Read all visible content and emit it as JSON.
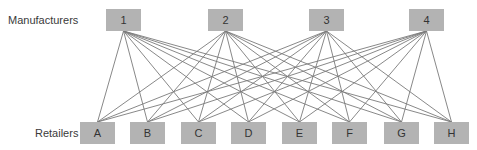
{
  "labels": {
    "manufacturers": "Manufacturers",
    "retailers": "Retailers"
  },
  "manufacturers": [
    {
      "id": "1",
      "x": 106,
      "y": 9,
      "w": 35,
      "h": 22
    },
    {
      "id": "2",
      "x": 208,
      "y": 9,
      "w": 35,
      "h": 22
    },
    {
      "id": "3",
      "x": 309,
      "y": 9,
      "w": 35,
      "h": 22
    },
    {
      "id": "4",
      "x": 409,
      "y": 9,
      "w": 35,
      "h": 22
    }
  ],
  "retailers": [
    {
      "id": "A",
      "x": 80,
      "y": 122,
      "w": 35,
      "h": 22
    },
    {
      "id": "B",
      "x": 130,
      "y": 122,
      "w": 35,
      "h": 22
    },
    {
      "id": "C",
      "x": 181,
      "y": 122,
      "w": 35,
      "h": 22
    },
    {
      "id": "D",
      "x": 231,
      "y": 122,
      "w": 35,
      "h": 22
    },
    {
      "id": "E",
      "x": 282,
      "y": 122,
      "w": 35,
      "h": 22
    },
    {
      "id": "F",
      "x": 332,
      "y": 122,
      "w": 35,
      "h": 22
    },
    {
      "id": "G",
      "x": 384,
      "y": 122,
      "w": 35,
      "h": 22
    },
    {
      "id": "H",
      "x": 434,
      "y": 122,
      "w": 35,
      "h": 22
    }
  ],
  "edges": "complete-bipartite",
  "colors": {
    "box": "#b3b3b3",
    "line": "#7a7a7a",
    "text": "#333333"
  }
}
